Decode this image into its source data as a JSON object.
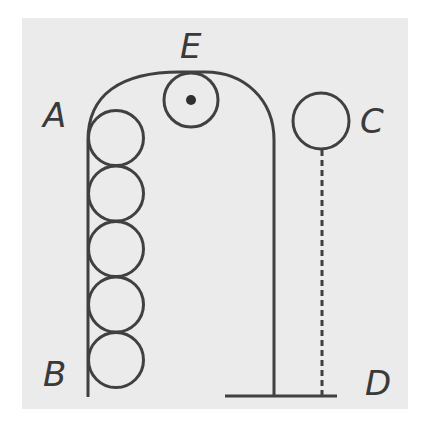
{
  "diagram": {
    "labels": {
      "A": "A",
      "B": "B",
      "C": "C",
      "D": "D",
      "E": "E"
    },
    "colors": {
      "background": "#ffffff",
      "panel": "#ebebeb",
      "stroke": "#404040"
    },
    "elements": {
      "track": "Inverted-U tube: left wall from A down to B, top arc, right wall down to base",
      "stacked_balls_count": 5,
      "ball_E": "Ball at top of arc with center dot",
      "ball_C": "Free ball outside track hanging above dashed line to D",
      "base_line": "Horizontal ground line at D"
    }
  }
}
